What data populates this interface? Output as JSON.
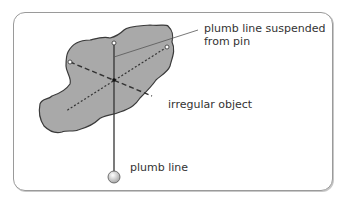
{
  "labels": {
    "plumb_line_pin_line1": "plumb line suspended",
    "plumb_line_pin_line2": "from pin",
    "irregular_object": "irregular object",
    "plumb_line": "plumb line"
  },
  "colors": {
    "object_fill": "#a9a9a9",
    "object_stroke": "#3a3a3a",
    "line": "#333333",
    "frame": "#9a9a9a",
    "bob": "#d8d8d8"
  }
}
